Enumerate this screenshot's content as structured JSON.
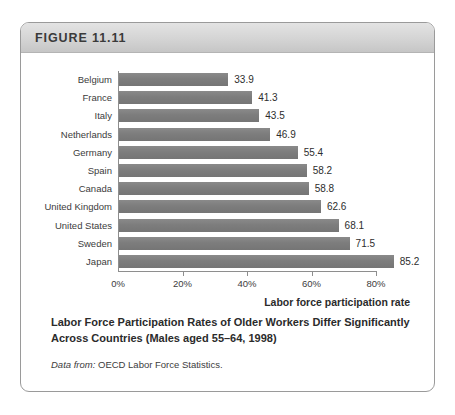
{
  "figure": {
    "header_label": "FIGURE 11.11",
    "caption_title": "Labor Force Participation Rates of Older Workers Differ Significantly Across Countries (Males aged 55–64, 1998)",
    "source_prefix": "Data from:",
    "source_text": "OECD Labor Force Statistics."
  },
  "colors": {
    "bar": "#7d7d7d",
    "header_band": "#d4d4d4",
    "card_border": "#9a9a9a",
    "axis": "#8e8e8e",
    "text": "#2b2b2b"
  },
  "chart_data": {
    "type": "bar",
    "orientation": "horizontal",
    "title": "Labor Force Participation Rates of Older Workers Differ Significantly Across Countries (Males aged 55–64, 1998)",
    "xlabel": "Labor force participation rate",
    "ylabel": "",
    "xlim": [
      0,
      100
    ],
    "grid": false,
    "legend": "none",
    "xtick_labels": [
      "0%",
      "20%",
      "40%",
      "60%",
      "80%"
    ],
    "xtick_values": [
      0,
      20,
      40,
      60,
      80
    ],
    "categories": [
      "Belgium",
      "France",
      "Italy",
      "Netherlands",
      "Germany",
      "Spain",
      "Canada",
      "United Kingdom",
      "United States",
      "Sweden",
      "Japan"
    ],
    "values": [
      33.9,
      41.3,
      43.5,
      46.9,
      55.4,
      58.2,
      58.8,
      62.6,
      68.1,
      71.5,
      85.2
    ],
    "value_labels": [
      "33.9",
      "41.3",
      "43.5",
      "46.9",
      "55.4",
      "58.2",
      "58.8",
      "62.6",
      "68.1",
      "71.5",
      "85.2"
    ]
  }
}
